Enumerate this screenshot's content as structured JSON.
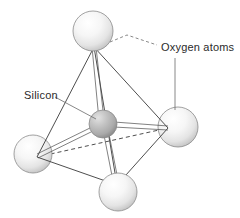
{
  "figure": {
    "background_color": "#ffffff",
    "width": 240,
    "height": 218,
    "labels": [
      {
        "id": "oxygen",
        "text": "Oxygen atoms",
        "x": 161,
        "y": 51,
        "anchor": "start"
      },
      {
        "id": "silicon",
        "text": "Silicon",
        "x": 24,
        "y": 99,
        "anchor": "start"
      }
    ],
    "leaders": [
      {
        "id": "oxygen-leader-top",
        "style": "dashed",
        "points": "110,42 126,35 156,45"
      },
      {
        "id": "oxygen-leader-right",
        "style": "solid",
        "points": "175,58 175,112"
      },
      {
        "id": "silicon-leader",
        "style": "solid",
        "points": "55,97 96,119"
      }
    ],
    "atoms": [
      {
        "id": "oxygen-top",
        "element": "O",
        "role": "oxygen",
        "cx": 93,
        "cy": 31,
        "r": 20,
        "fill": "#f0f0f0",
        "highlight": "#ffffff",
        "shadow": "#c9c9c9"
      },
      {
        "id": "oxygen-right",
        "element": "O",
        "role": "oxygen",
        "cx": 178,
        "cy": 127,
        "r": 20,
        "fill": "#f0f0f0",
        "highlight": "#ffffff",
        "shadow": "#c9c9c9"
      },
      {
        "id": "oxygen-left",
        "element": "O",
        "role": "oxygen",
        "cx": 33,
        "cy": 154,
        "r": 19,
        "fill": "#f0f0f0",
        "highlight": "#ffffff",
        "shadow": "#c9c9c9"
      },
      {
        "id": "oxygen-bottom",
        "element": "O",
        "role": "oxygen",
        "cx": 118,
        "cy": 192,
        "r": 19,
        "fill": "#f0f0f0",
        "highlight": "#ffffff",
        "shadow": "#c9c9c9"
      },
      {
        "id": "silicon-center",
        "element": "Si",
        "role": "silicon",
        "cx": 103,
        "cy": 124,
        "r": 14,
        "fill": "#b4b4b4",
        "highlight": "#dedede",
        "shadow": "#8f8f8f"
      }
    ],
    "vertices": {
      "top": {
        "x": 94,
        "y": 47
      },
      "right": {
        "x": 168,
        "y": 128
      },
      "left": {
        "x": 37,
        "y": 157
      },
      "bottom": {
        "x": 117,
        "y": 185
      },
      "center": {
        "x": 103,
        "y": 124
      }
    },
    "edges": [
      {
        "id": "edge-top-left",
        "from": "top",
        "to": "left",
        "hidden": false
      },
      {
        "id": "edge-top-right",
        "from": "top",
        "to": "right",
        "hidden": false
      },
      {
        "id": "edge-top-bottom",
        "from": "top",
        "to": "bottom",
        "hidden": false
      },
      {
        "id": "edge-left-bottom",
        "from": "left",
        "to": "bottom",
        "hidden": false
      },
      {
        "id": "edge-bottom-right",
        "from": "bottom",
        "to": "right",
        "hidden": false
      },
      {
        "id": "edge-left-right",
        "from": "left",
        "to": "right",
        "hidden": true
      }
    ],
    "bonds": [
      {
        "id": "bond-si-top",
        "from": "center",
        "to": "top"
      },
      {
        "id": "bond-si-right",
        "from": "center",
        "to": "right"
      },
      {
        "id": "bond-si-left",
        "from": "center",
        "to": "left"
      },
      {
        "id": "bond-si-bottom",
        "from": "center",
        "to": "bottom"
      }
    ],
    "colors": {
      "line": "#3a3a3a",
      "bond": "#4a4a4a",
      "leader": "#6a6a6a",
      "text": "#2b2b2b",
      "oxygen_fill": "#f0f0f0",
      "silicon_fill": "#b4b4b4"
    }
  }
}
